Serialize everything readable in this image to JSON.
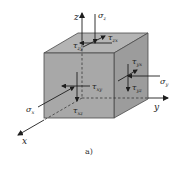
{
  "figure": {
    "caption": "a)",
    "colors": {
      "front_face": "#a8a8a8",
      "top_face": "#b4b4b4",
      "right_face": "#9c9c9c",
      "edge": "#4a4a4a",
      "line": "#1e1e1e"
    },
    "axes": {
      "x": "x",
      "y": "y",
      "z": "z"
    },
    "labels": {
      "sigma_z": "σ",
      "sigma_z_sub": "z",
      "tau_zx": "τ",
      "tau_zx_sub": "zx",
      "tau_zy": "τ",
      "tau_zy_sub": "zy",
      "tau_xy": "τ",
      "tau_xy_sub": "xy",
      "tau_xz": "τ",
      "tau_xz_sub": "xz",
      "sigma_x": "σ",
      "sigma_x_sub": "x",
      "tau_yz": "τ",
      "tau_yz_sub": "yz",
      "tau_yx": "τ",
      "tau_yx_sub": "yx",
      "sigma_y": "σ",
      "sigma_y_sub": "y"
    }
  }
}
